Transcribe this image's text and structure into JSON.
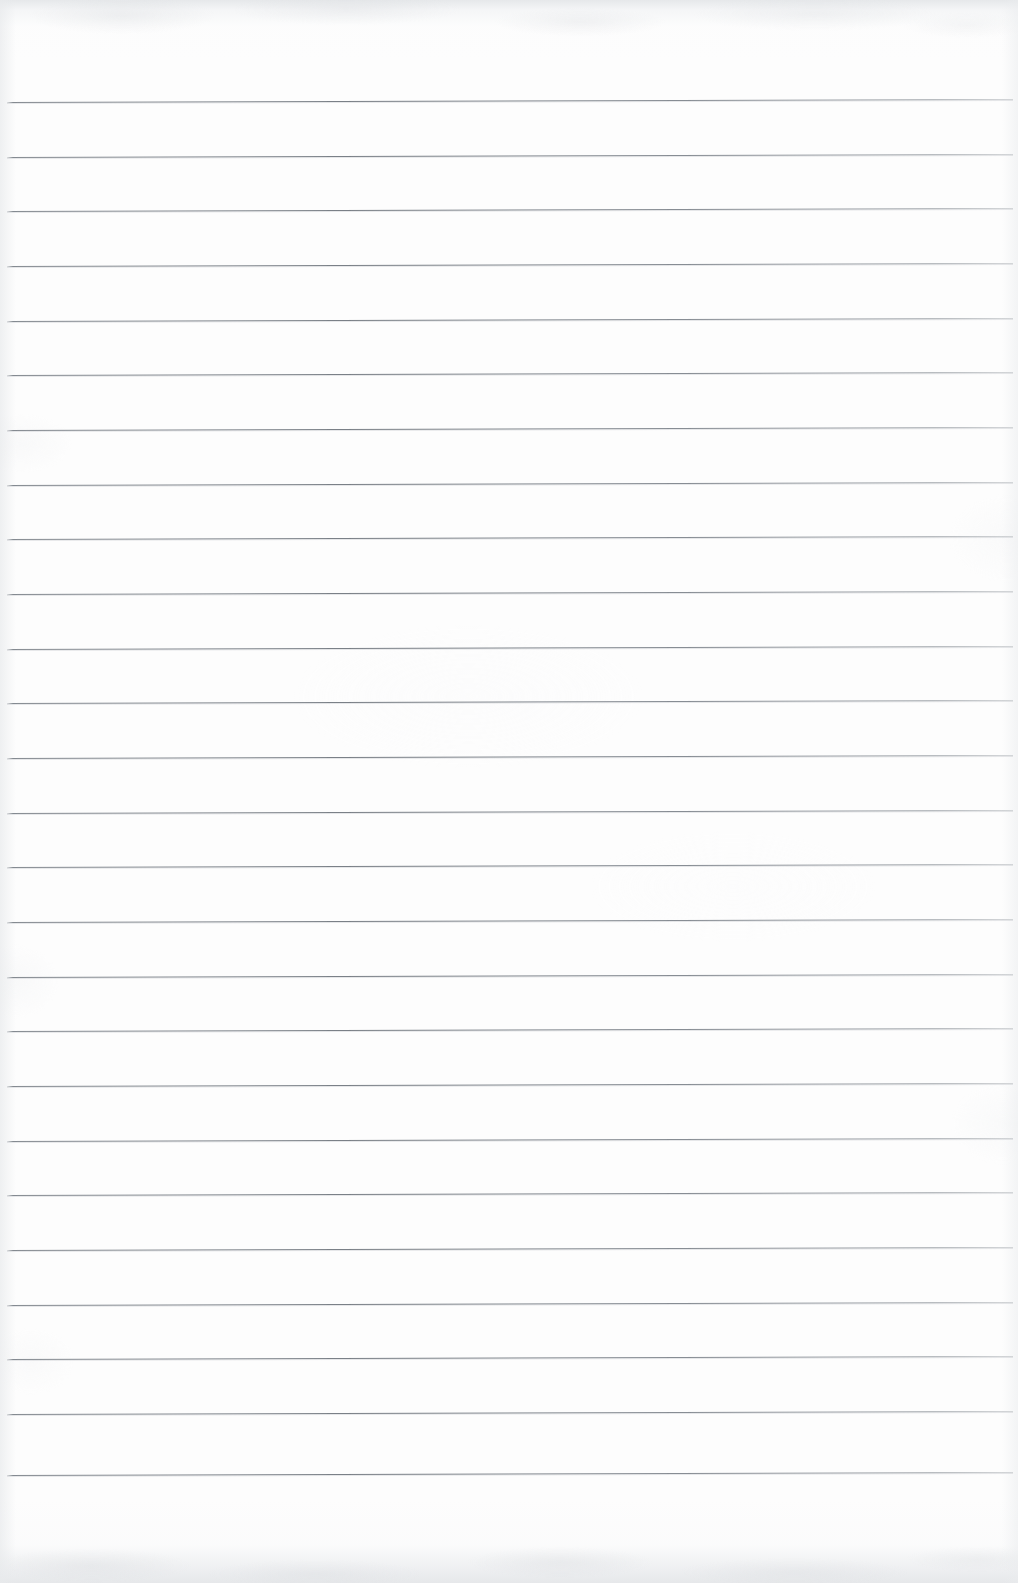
{
  "document": {
    "kind": "scanned-blank-ruled-paper",
    "orientation": "portrait",
    "page_width_px": 1018,
    "page_height_px": 1583,
    "text_content": "",
    "handwriting_present": false,
    "printed_text_present": false,
    "margin_rule_present": false,
    "page_number_label": "",
    "header_label": "",
    "footer_label": ""
  },
  "colors": {
    "paper": "#fdfdfd",
    "rule_line": "#7e848b",
    "edge_shadow": "#e2e4e7",
    "grain_highlight": "#fafafb"
  },
  "ruling": {
    "style": "horizontal-ruled",
    "line_count": 26,
    "line_spacing_px": 54.6,
    "line_thickness_px": 1,
    "first_line_y_px": 102,
    "last_line_y_px": 1475,
    "line_start_x_px": 7,
    "line_end_x_px": 1013,
    "skew_deg": -0.17,
    "top_margin_px": 102,
    "bottom_margin_px": 108,
    "lines": [
      {
        "index": 1,
        "y": 102
      },
      {
        "index": 2,
        "y": 157
      },
      {
        "index": 3,
        "y": 211
      },
      {
        "index": 4,
        "y": 266
      },
      {
        "index": 5,
        "y": 321
      },
      {
        "index": 6,
        "y": 375
      },
      {
        "index": 7,
        "y": 430
      },
      {
        "index": 8,
        "y": 485
      },
      {
        "index": 9,
        "y": 539
      },
      {
        "index": 10,
        "y": 594
      },
      {
        "index": 11,
        "y": 649
      },
      {
        "index": 12,
        "y": 703
      },
      {
        "index": 13,
        "y": 758
      },
      {
        "index": 14,
        "y": 813
      },
      {
        "index": 15,
        "y": 867
      },
      {
        "index": 16,
        "y": 922
      },
      {
        "index": 17,
        "y": 977
      },
      {
        "index": 18,
        "y": 1031
      },
      {
        "index": 19,
        "y": 1086
      },
      {
        "index": 20,
        "y": 1141
      },
      {
        "index": 21,
        "y": 1195
      },
      {
        "index": 22,
        "y": 1250
      },
      {
        "index": 23,
        "y": 1305
      },
      {
        "index": 24,
        "y": 1359
      },
      {
        "index": 25,
        "y": 1414
      },
      {
        "index": 26,
        "y": 1475
      }
    ]
  },
  "scan_artifacts": {
    "top_edge_band_height_px": 26,
    "bottom_edge_band_height_px": 28,
    "description": "mottled light-gray scanner bands along top and bottom edges"
  }
}
